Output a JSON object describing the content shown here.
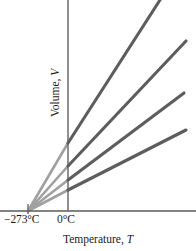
{
  "figure": {
    "width": 196,
    "height": 251,
    "background": "#ffffff"
  },
  "axes": {
    "x_title_text": "Temperature, ",
    "x_title_var": "T",
    "y_title_text": "Volume, ",
    "y_title_var": "V",
    "x_tick_labels": [
      "−273°C",
      "0°C"
    ],
    "axis_color": "#5a5a5a",
    "label_color": "#1b1b1b"
  },
  "chart_data": {
    "type": "line",
    "title": "",
    "subtitle": "",
    "xlabel": "Temperature, T",
    "ylabel": "Volume, V",
    "xtick_labels": [
      "−273°C",
      "0°C"
    ],
    "xtick_values": [
      -273,
      0
    ],
    "ytick_labels": [],
    "grid": false,
    "legend": false,
    "legend_position": "none",
    "xlim": [
      -273,
      865
    ],
    "ylim": [
      0,
      1
    ],
    "annotations": [
      "All four lines extrapolate back to a common intercept at −273°C (absolute zero), where volume would be zero.",
      "Solid dark segments are measured data above 0°C; lighter segments left of the vertical axis are extrapolations."
    ],
    "convergence_point": {
      "x": -273,
      "y": 0,
      "label": "−273°C"
    },
    "series": [
      {
        "name": "Sample 1 (steepest slope)",
        "color_measured": "#5d5d5d",
        "color_extrapolated": "#a0a0a0",
        "intercept_x_celsius": -273,
        "value_at_0C": 0.324,
        "value_at_end": 1.0,
        "px_start": [
          28,
          211
        ],
        "px_axis_cross": [
          68,
          143
        ],
        "px_end": [
          160,
          0
        ]
      },
      {
        "name": "Sample 2",
        "color_measured": "#5d5d5d",
        "color_extrapolated": "#a0a0a0",
        "intercept_x_celsius": -273,
        "value_at_0C": 0.213,
        "value_at_end": 0.806,
        "px_start": [
          28,
          211
        ],
        "px_axis_cross": [
          68,
          166
        ],
        "px_end": [
          186,
          41
        ]
      },
      {
        "name": "Sample 3",
        "color_measured": "#5d5d5d",
        "color_extrapolated": "#a0a0a0",
        "intercept_x_celsius": -273,
        "value_at_0C": 0.147,
        "value_at_end": 0.559,
        "px_start": [
          28,
          211
        ],
        "px_axis_cross": [
          68,
          180
        ],
        "px_end": [
          184,
          93
        ]
      },
      {
        "name": "Sample 4 (shallowest slope)",
        "color_measured": "#5d5d5d",
        "color_extrapolated": "#a0a0a0",
        "intercept_x_celsius": -273,
        "value_at_0C": 0.1,
        "value_at_end": 0.384,
        "px_start": [
          28,
          211
        ],
        "px_axis_cross": [
          68,
          190
        ],
        "px_end": [
          186,
          130
        ]
      }
    ]
  }
}
